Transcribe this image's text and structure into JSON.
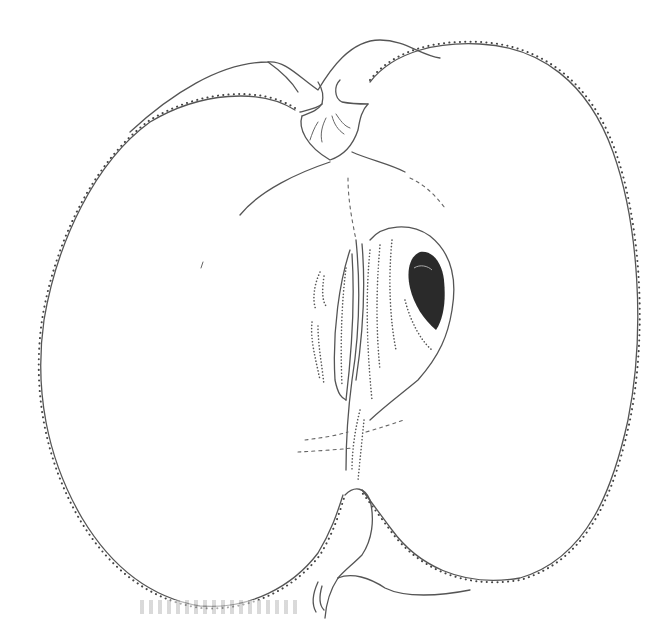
{
  "figure": {
    "parts": [
      {
        "id": "left-lobe",
        "name": "Left flesh lobe"
      },
      {
        "id": "right-lobe",
        "name": "Right flesh lobe"
      },
      {
        "id": "stem-cavity",
        "name": "Stem cavity / stalk"
      },
      {
        "id": "core-line",
        "name": "Core vascular line"
      },
      {
        "id": "locule",
        "name": "Seed chamber (locule)"
      },
      {
        "id": "seed",
        "name": "Seed"
      },
      {
        "id": "calyx",
        "name": "Calyx end"
      }
    ],
    "colors": {
      "background": "#ffffff",
      "ink": "#555555",
      "seed": "#2a2a2a"
    }
  }
}
